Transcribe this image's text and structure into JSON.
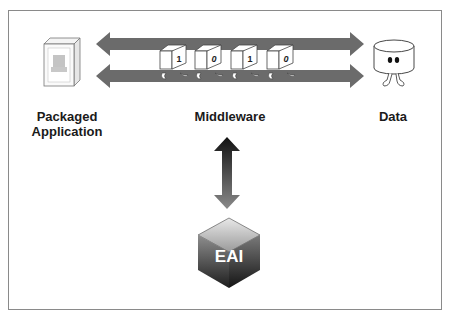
{
  "diagram": {
    "nodes": {
      "left": {
        "label_line1": "Packaged",
        "label_line2": "Application",
        "icon": "packaged-application-box-icon"
      },
      "middle": {
        "label": "Middleware",
        "icon": "bidirectional-data-flow-arrows"
      },
      "right": {
        "label": "Data",
        "icon": "database-cylinder-character-icon"
      },
      "bottom": {
        "label": "EAI",
        "icon": "eai-hexagon-cube-icon"
      }
    },
    "bits": [
      "1",
      "0",
      "1",
      "0"
    ],
    "connectors": [
      {
        "from": "Packaged Application",
        "to": "Data",
        "type": "double-headed horizontal arrow (x2)"
      },
      {
        "from": "Middleware",
        "to": "EAI",
        "type": "double-headed vertical arrow"
      }
    ]
  },
  "colors": {
    "arrow_gray": "#6b6b6b",
    "frame_border": "#8a8a8a",
    "eai_dark": "#2a2a2a",
    "eai_light": "#cfcfcf"
  }
}
